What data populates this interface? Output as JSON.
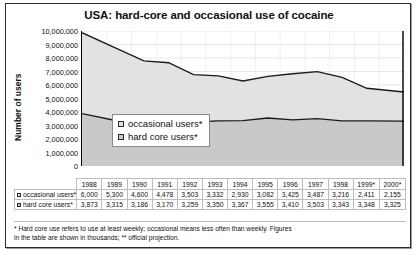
{
  "chart_data": {
    "type": "area",
    "stacked": true,
    "title": "USA: hard-core and occasional use of cocaine",
    "xlabel": "",
    "ylabel": "Number of users",
    "ylim": [
      0,
      10000000
    ],
    "ytick_labels": [
      "10,000,000",
      "9,000,000",
      "8,000,000",
      "7,000,000",
      "6,000,000",
      "5,000,000",
      "4,000,000",
      "3,000,000",
      "2,000,000",
      "1,000,000",
      "0"
    ],
    "ytick_values": [
      10000000,
      9000000,
      8000000,
      7000000,
      6000000,
      5000000,
      4000000,
      3000000,
      2000000,
      1000000,
      0
    ],
    "grid": true,
    "legend_position": "inside-center",
    "units_note": "Figures in the table are shown in thousands",
    "categories": [
      "1988",
      "1989",
      "1990",
      "1991",
      "1992",
      "1993",
      "1994",
      "1995",
      "1996",
      "1997",
      "1998",
      "1999*",
      "2000*"
    ],
    "series": [
      {
        "name": "occasional users*",
        "color": "#e2e2e2",
        "values": [
          6000,
          5300,
          4600,
          4478,
          3503,
          3332,
          2930,
          3082,
          3425,
          3487,
          3216,
          2411,
          2155
        ]
      },
      {
        "name": "hard core users*",
        "color": "#c9c9c9",
        "values": [
          3873,
          3315,
          3186,
          3170,
          3259,
          3350,
          3367,
          3555,
          3410,
          3503,
          3343,
          3348,
          3325
        ]
      }
    ]
  },
  "legend": {
    "items": [
      {
        "label": "occasional  users*",
        "color": "#e2e2e2"
      },
      {
        "label": "hard core users*",
        "color": "#c9c9c9"
      }
    ]
  },
  "table": {
    "year_headers": [
      "1988",
      "1989",
      "1990",
      "1991",
      "1992",
      "1993",
      "1994",
      "1995",
      "1996",
      "1997",
      "1998",
      "1999*",
      "2000*"
    ],
    "rows": [
      {
        "label": "occasional  users*",
        "swatch": "#e2e2e2",
        "values": [
          "6,000",
          "5,300",
          "4,600",
          "4,478",
          "3,503",
          "3,332",
          "2,930",
          "3,082",
          "3,425",
          "3,487",
          "3,216",
          "2,411",
          "2,155"
        ]
      },
      {
        "label": "hard core users*",
        "swatch": "#c9c9c9",
        "values": [
          "3,873",
          "3,315",
          "3,186",
          "3,170",
          "3,259",
          "3,350",
          "3,367",
          "3,555",
          "3,410",
          "3,503",
          "3,343",
          "3,348",
          "3,325"
        ]
      }
    ]
  },
  "footnote": {
    "line1": "* Hard core use refers to use at least weekly; occasional means less often than weekly. Figures",
    "line2": "in the table are shown in thousands;  ** official projection."
  }
}
